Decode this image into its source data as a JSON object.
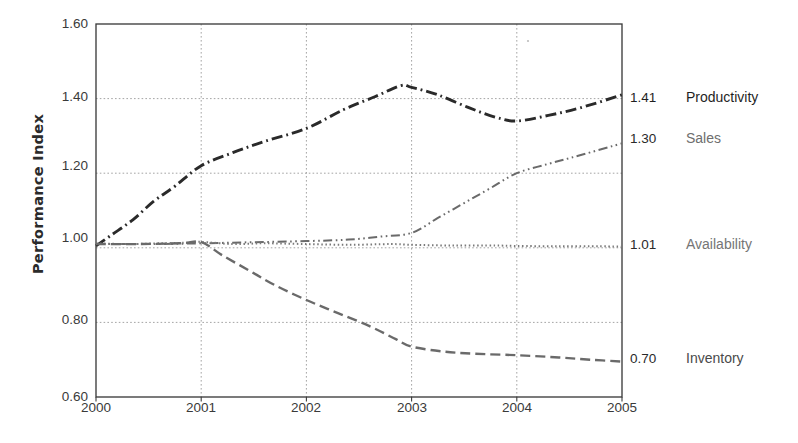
{
  "chart_data": {
    "type": "line",
    "title": "",
    "xlabel": "",
    "ylabel": "Performance Index",
    "x": [
      2000,
      2001,
      2002,
      2003,
      2004,
      2005
    ],
    "xlim": [
      2000,
      2005
    ],
    "ylim": [
      0.6,
      1.6
    ],
    "ytick_labels": [
      "1.60",
      "1.40",
      "1.20",
      "1.00",
      "0.80",
      "0.60"
    ],
    "ytick_values": [
      1.6,
      1.4,
      1.2,
      1.0,
      0.8,
      0.6
    ],
    "xtick_labels": [
      "2000",
      "2001",
      "2002",
      "2003",
      "2004",
      "2005"
    ],
    "grid": "dotted gridlines on both axes",
    "legend_position": "right-of-plot end labels",
    "series": [
      {
        "name": "Productivity",
        "end_value": "1.41",
        "color": "#2a2a2a",
        "dash": "dash-dot",
        "values": [
          1.0,
          1.22,
          1.32,
          1.43,
          1.34,
          1.41
        ],
        "points": [
          [
            2000.0,
            1.005
          ],
          [
            2000.15,
            1.035
          ],
          [
            2000.35,
            1.075
          ],
          [
            2000.55,
            1.125
          ],
          [
            2000.75,
            1.165
          ],
          [
            2001.0,
            1.22
          ],
          [
            2001.3,
            1.255
          ],
          [
            2001.6,
            1.285
          ],
          [
            2002.0,
            1.32
          ],
          [
            2002.35,
            1.37
          ],
          [
            2002.65,
            1.405
          ],
          [
            2002.9,
            1.435
          ],
          [
            2003.0,
            1.43
          ],
          [
            2003.25,
            1.41
          ],
          [
            2003.55,
            1.375
          ],
          [
            2003.8,
            1.35
          ],
          [
            2004.0,
            1.34
          ],
          [
            2004.3,
            1.355
          ],
          [
            2004.6,
            1.375
          ],
          [
            2005.0,
            1.41
          ]
        ]
      },
      {
        "name": "Sales",
        "end_value": "1.30",
        "color": "#6a6a6a",
        "dash": "dash-dot-dot",
        "values": [
          1.01,
          1.01,
          1.02,
          1.04,
          1.2,
          1.28
        ],
        "points": [
          [
            2000.0,
            1.01
          ],
          [
            2000.5,
            1.01
          ],
          [
            2001.0,
            1.012
          ],
          [
            2001.5,
            1.015
          ],
          [
            2002.0,
            1.018
          ],
          [
            2002.4,
            1.022
          ],
          [
            2002.7,
            1.03
          ],
          [
            2003.0,
            1.04
          ],
          [
            2003.25,
            1.08
          ],
          [
            2003.5,
            1.12
          ],
          [
            2003.75,
            1.16
          ],
          [
            2004.0,
            1.2
          ],
          [
            2004.3,
            1.225
          ],
          [
            2004.6,
            1.248
          ],
          [
            2005.0,
            1.28
          ]
        ]
      },
      {
        "name": "Availability",
        "end_value": "1.01",
        "color": "#7a7a7a",
        "dash": "fine-dotted",
        "values": [
          1.01,
          1.01,
          1.01,
          1.01,
          1.0,
          1.0
        ],
        "points": [
          [
            2000.0,
            1.012
          ],
          [
            2000.3,
            1.01
          ],
          [
            2000.6,
            1.012
          ],
          [
            2000.9,
            1.014
          ],
          [
            2001.0,
            1.016
          ],
          [
            2001.3,
            1.01
          ],
          [
            2001.6,
            1.012
          ],
          [
            2002.0,
            1.01
          ],
          [
            2002.4,
            1.008
          ],
          [
            2002.8,
            1.01
          ],
          [
            2003.0,
            1.008
          ],
          [
            2003.4,
            1.006
          ],
          [
            2003.8,
            1.006
          ],
          [
            2004.0,
            1.005
          ],
          [
            2004.4,
            1.004
          ],
          [
            2004.8,
            1.004
          ],
          [
            2005.0,
            1.003
          ]
        ]
      },
      {
        "name": "Inventory",
        "end_value": "0.70",
        "color": "#6a6a6a",
        "dash": "dashed",
        "values": [
          1.01,
          1.01,
          0.86,
          0.73,
          0.71,
          0.7
        ],
        "points": [
          [
            2000.0,
            1.01
          ],
          [
            2000.4,
            1.01
          ],
          [
            2000.8,
            1.012
          ],
          [
            2001.0,
            1.015
          ],
          [
            2001.2,
            0.98
          ],
          [
            2001.45,
            0.94
          ],
          [
            2001.7,
            0.9
          ],
          [
            2002.0,
            0.86
          ],
          [
            2002.3,
            0.825
          ],
          [
            2002.6,
            0.79
          ],
          [
            2002.85,
            0.755
          ],
          [
            2003.0,
            0.735
          ],
          [
            2003.3,
            0.722
          ],
          [
            2003.6,
            0.716
          ],
          [
            2004.0,
            0.712
          ],
          [
            2004.4,
            0.706
          ],
          [
            2004.7,
            0.7
          ],
          [
            2005.0,
            0.695
          ]
        ]
      }
    ]
  },
  "axis": {
    "y_title": "Performance Index",
    "y_ticks": [
      "1.60",
      "1.40",
      "1.20",
      "1.00",
      "0.80",
      "0.60"
    ],
    "x_ticks": [
      "2000",
      "2001",
      "2002",
      "2003",
      "2004",
      "2005"
    ]
  },
  "end_labels": [
    {
      "value": "1.41",
      "name": "Productivity"
    },
    {
      "value": "1.30",
      "name": "Sales"
    },
    {
      "value": "1.01",
      "name": "Availability"
    },
    {
      "value": "0.70",
      "name": "Inventory"
    }
  ]
}
